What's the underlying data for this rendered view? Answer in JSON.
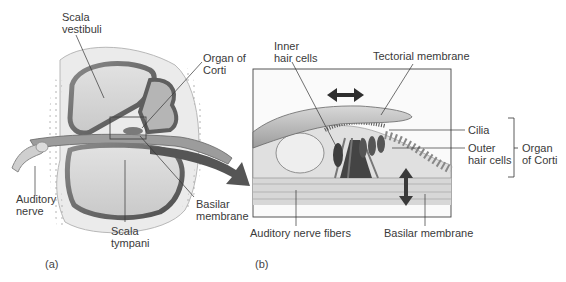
{
  "panel_a": {
    "id_label": "(a)",
    "labels": {
      "scala_vestibuli": "Scala\nvestibuli",
      "organ_of_corti": "Organ of\nCorti",
      "auditory_nerve": "Auditory\nnerve",
      "basilar_membrane": "Basilar\nmembrane",
      "scala_tympani": "Scala\ntympani"
    }
  },
  "panel_b": {
    "id_label": "(b)",
    "labels": {
      "inner_hair_cells": "Inner\nhair cells",
      "tectorial_membrane": "Tectorial membrane",
      "cilia": "Cilia",
      "outer_hair_cells": "Outer\nhair cells",
      "organ_of_corti": "Organ\nof Corti",
      "auditory_nerve_fibers": "Auditory nerve fibers",
      "basilar_membrane": "Basilar membrane"
    },
    "arrows": {
      "tectorial_motion": "horizontal-double-arrow",
      "basilar_motion": "vertical-double-arrow"
    }
  },
  "colors": {
    "bone": "#e8e8e8",
    "chamber": "#d6d6d6",
    "dark_wall": "#6f6f6f",
    "membrane": "#9a9a9a",
    "text": "#3a3a3a",
    "line": "#333333"
  }
}
